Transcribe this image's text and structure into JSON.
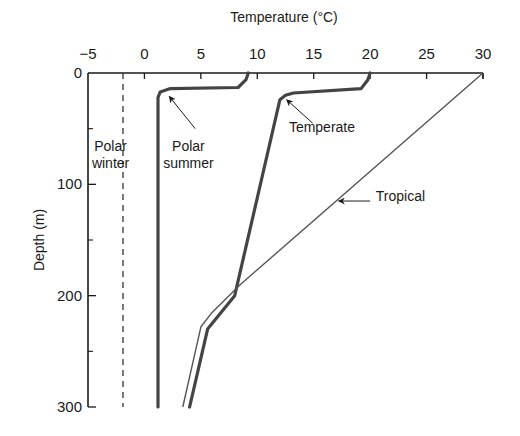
{
  "chart_data": {
    "type": "line",
    "title": "",
    "xlabel": "Temperature (°C)",
    "ylabel": "Depth (m)",
    "xlim": [
      -5,
      30
    ],
    "ylim": [
      0,
      300
    ],
    "y_inverted": true,
    "x_axis_position": "top",
    "x_ticks": [
      -5,
      0,
      5,
      10,
      15,
      20,
      25,
      30
    ],
    "y_ticks": [
      0,
      100,
      200,
      300
    ],
    "y_minor_ticks": [
      50,
      150,
      250
    ],
    "grid": false,
    "legend": "none",
    "series": [
      {
        "name": "Polar winter",
        "style": "dashed",
        "points": [
          [
            -1.9,
            0
          ],
          [
            -1.9,
            300
          ]
        ]
      },
      {
        "name": "Polar summer",
        "style": "thick",
        "points": [
          [
            9.2,
            0
          ],
          [
            9.0,
            6
          ],
          [
            8.3,
            13
          ],
          [
            2.3,
            14
          ],
          [
            1.4,
            17
          ],
          [
            1.2,
            22
          ],
          [
            1.2,
            300
          ]
        ]
      },
      {
        "name": "Temperate",
        "style": "thick",
        "points": [
          [
            20.0,
            0
          ],
          [
            19.8,
            6
          ],
          [
            19.2,
            14
          ],
          [
            13.2,
            18
          ],
          [
            12.5,
            20
          ],
          [
            12.0,
            24
          ],
          [
            8.0,
            200
          ],
          [
            5.6,
            230
          ],
          [
            4.0,
            300
          ]
        ]
      },
      {
        "name": "Tropical",
        "style": "thin",
        "points": [
          [
            30.0,
            0
          ],
          [
            8.5,
            190
          ],
          [
            6.0,
            215
          ],
          [
            5.0,
            228
          ],
          [
            3.4,
            300
          ]
        ]
      }
    ],
    "annotations": [
      {
        "text": "Polar\nwinter",
        "lines": [
          "Polar",
          "winter"
        ],
        "at": [
          -3.0,
          70
        ],
        "arrow": false
      },
      {
        "text": "Polar\nsummer",
        "lines": [
          "Polar",
          "summer"
        ],
        "at": [
          3.9,
          70
        ],
        "arrow_to": [
          2.2,
          21
        ],
        "arrow_from": [
          4.5,
          50
        ]
      },
      {
        "text": "Temperate",
        "lines": [
          "Temperate"
        ],
        "at": [
          12.8,
          53
        ],
        "arrow_to": [
          12.6,
          24
        ],
        "arrow_from": [
          14.9,
          45
        ]
      },
      {
        "text": "Tropical",
        "lines": [
          "Tropical"
        ],
        "at": [
          20.5,
          115
        ],
        "arrow_to": [
          17.2,
          115
        ],
        "arrow_from": [
          20.0,
          115
        ]
      }
    ]
  }
}
